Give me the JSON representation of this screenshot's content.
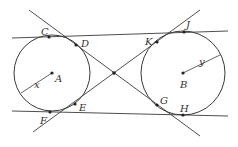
{
  "diagram": {
    "colors": {
      "stroke": "#3a3a3a",
      "point": "#222222",
      "label": "#333333",
      "background": "#ffffff"
    },
    "circles": [
      {
        "id": "A",
        "center_label": "A",
        "radius_label": "x",
        "cx": 52,
        "cy": 73,
        "r": 38
      },
      {
        "id": "B",
        "center_label": "B",
        "radius_label": "y",
        "cx": 183,
        "cy": 73,
        "r": 42
      }
    ],
    "points": {
      "C": "C",
      "D": "D",
      "E": "E",
      "F": "F",
      "G": "G",
      "H": "H",
      "J": "J",
      "K": "K"
    },
    "lines": [
      {
        "name": "top-common-tangent",
        "through": [
          "C",
          "J"
        ]
      },
      {
        "name": "bottom-common-tangent",
        "through": [
          "F",
          "H"
        ]
      },
      {
        "name": "internal-tangent-1",
        "through": [
          "D",
          "G"
        ]
      },
      {
        "name": "internal-tangent-2",
        "through": [
          "E",
          "K"
        ]
      }
    ]
  }
}
